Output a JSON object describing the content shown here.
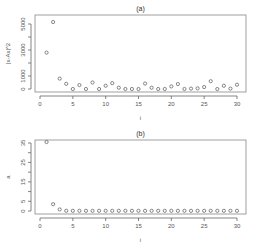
{
  "chart_data": [
    {
      "type": "scatter",
      "title": "(a)",
      "xlabel": "i",
      "ylabel": "|x-Ax|^2",
      "xlim": [
        0,
        31
      ],
      "ylim": [
        0,
        5200
      ],
      "xticks": [
        0,
        5,
        10,
        15,
        20,
        25,
        30
      ],
      "yticks": [
        0,
        1000,
        3000,
        5000
      ],
      "yticks_minor": [
        0,
        1000,
        2000,
        3000,
        4000,
        5000
      ],
      "grid": false,
      "marker": "circle-open",
      "x": [
        1,
        2,
        3,
        4,
        5,
        6,
        7,
        8,
        9,
        10,
        11,
        12,
        13,
        14,
        15,
        16,
        17,
        18,
        19,
        20,
        21,
        22,
        23,
        24,
        25,
        26,
        27,
        28,
        29,
        30
      ],
      "values": [
        2800,
        5150,
        800,
        400,
        0,
        300,
        0,
        500,
        0,
        250,
        450,
        100,
        0,
        0,
        0,
        420,
        100,
        0,
        0,
        200,
        380,
        0,
        30,
        50,
        150,
        600,
        0,
        250,
        30,
        330
      ]
    },
    {
      "type": "scatter",
      "title": "(b)",
      "xlabel": "i",
      "ylabel": "a",
      "xlim": [
        0,
        31
      ],
      "ylim": [
        0,
        36
      ],
      "xticks": [
        0,
        5,
        10,
        15,
        20,
        25,
        30
      ],
      "yticks": [
        0,
        5,
        15,
        25,
        35
      ],
      "yticks_minor": [
        0,
        5,
        10,
        15,
        20,
        25,
        30,
        35
      ],
      "grid": false,
      "marker": "circle-open",
      "x": [
        1,
        2,
        3,
        4,
        5,
        6,
        7,
        8,
        9,
        10,
        11,
        12,
        13,
        14,
        15,
        16,
        17,
        18,
        19,
        20,
        21,
        22,
        23,
        24,
        25,
        26,
        27,
        28,
        29,
        30
      ],
      "values": [
        35.5,
        3.5,
        0.8,
        0.1,
        0.1,
        0.1,
        0.1,
        0.1,
        0.1,
        0.1,
        0.1,
        0.1,
        0.1,
        0.1,
        0.1,
        0.1,
        0.1,
        0.1,
        0.1,
        0.1,
        0.1,
        0.1,
        0.1,
        0.1,
        0.1,
        0.1,
        0.1,
        0.1,
        0.1,
        0.1
      ]
    }
  ]
}
